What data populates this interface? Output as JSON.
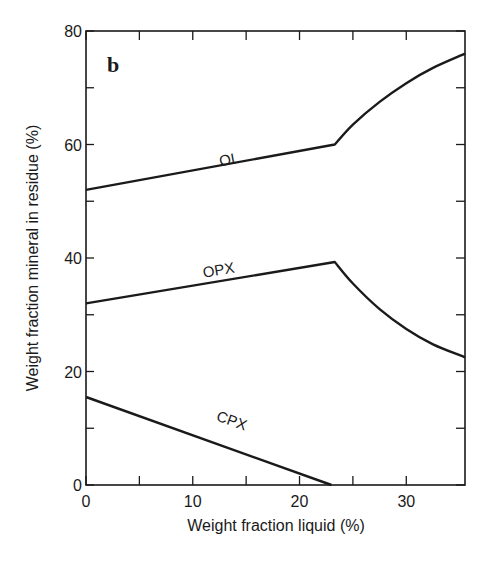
{
  "chart_data": {
    "type": "line",
    "panel_label": "b",
    "title": "",
    "xlabel": "Weight fraction liquid (%)",
    "ylabel": "Weight fraction mineral in residue (%)",
    "xlim": [
      0,
      35.5
    ],
    "ylim": [
      0,
      80
    ],
    "x_ticks": [
      0,
      10,
      20,
      30
    ],
    "x_minor_ticks": [
      5,
      15,
      25
    ],
    "y_ticks": [
      0,
      20,
      40,
      60,
      80
    ],
    "y_minor_ticks": [
      10,
      30,
      50,
      70
    ],
    "grid": false,
    "legend": "none (inline labels)",
    "series": [
      {
        "name": "OL",
        "points": [
          [
            0,
            52
          ],
          [
            23.3,
            60
          ],
          [
            25,
            63.5
          ],
          [
            27.5,
            67.5
          ],
          [
            30,
            70.8
          ],
          [
            32.5,
            73.5
          ],
          [
            35.5,
            76
          ]
        ]
      },
      {
        "name": "OPX",
        "points": [
          [
            0,
            32
          ],
          [
            23.3,
            39.3
          ],
          [
            25,
            35.5
          ],
          [
            27.5,
            31
          ],
          [
            30,
            27.5
          ],
          [
            32.5,
            24.8
          ],
          [
            35.5,
            22.5
          ]
        ]
      },
      {
        "name": "CPX",
        "points": [
          [
            0,
            15.5
          ],
          [
            23,
            0
          ]
        ]
      }
    ],
    "annotations": [
      {
        "text": "OL",
        "x": 13.5,
        "y": 56.5
      },
      {
        "text": "OPX",
        "x": 12.5,
        "y": 37
      },
      {
        "text": "CPX",
        "x": 13.5,
        "y": 10.5
      }
    ]
  }
}
